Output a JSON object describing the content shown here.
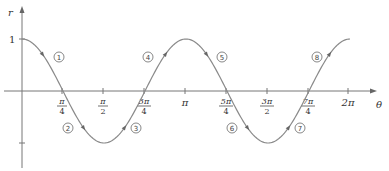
{
  "chart_data": {
    "type": "line",
    "title": "",
    "function": "r = cos 2θ",
    "xlabel": "θ",
    "ylabel": "r",
    "xlim": [
      0,
      6.2832
    ],
    "ylim": [
      -1,
      1
    ],
    "grid": false,
    "legend": null,
    "x_ticks": [
      {
        "value": 0.7854,
        "num": "π",
        "den": "4"
      },
      {
        "value": 1.5708,
        "num": "π",
        "den": "2"
      },
      {
        "value": 2.3562,
        "num": "3π",
        "den": "4"
      },
      {
        "value": 3.1416,
        "label": "π"
      },
      {
        "value": 3.927,
        "num": "5π",
        "den": "4"
      },
      {
        "value": 4.7124,
        "num": "3π",
        "den": "2"
      },
      {
        "value": 5.4978,
        "num": "7π",
        "den": "4"
      },
      {
        "value": 6.2832,
        "label": "2π"
      }
    ],
    "y_ticks": [
      {
        "value": 1,
        "label": "1"
      },
      {
        "value": -1,
        "label": ""
      }
    ],
    "series": [
      {
        "name": "cos 2θ",
        "x": [
          0,
          0.3927,
          0.7854,
          1.1781,
          1.5708,
          1.9635,
          2.3562,
          2.7489,
          3.1416,
          3.5343,
          3.927,
          4.3197,
          4.7124,
          5.1051,
          5.4978,
          5.8905,
          6.2832
        ],
        "values": [
          1,
          0.7071,
          0,
          -0.7071,
          -1,
          -0.7071,
          0,
          0.7071,
          1,
          0.7071,
          0,
          -0.7071,
          -1,
          -0.7071,
          0,
          0.7071,
          1
        ]
      }
    ],
    "annotations": [
      {
        "label": "①",
        "segment": 1,
        "theta_range": "0 to π/4"
      },
      {
        "label": "②",
        "segment": 2,
        "theta_range": "π/4 to π/2"
      },
      {
        "label": "③",
        "segment": 3,
        "theta_range": "π/2 to 3π/4"
      },
      {
        "label": "④",
        "segment": 4,
        "theta_range": "3π/4 to π"
      },
      {
        "label": "⑤",
        "segment": 5,
        "theta_range": "π to 5π/4"
      },
      {
        "label": "⑥",
        "segment": 6,
        "theta_range": "5π/4 to 3π/2"
      },
      {
        "label": "⑦",
        "segment": 7,
        "theta_range": "3π/2 to 7π/4"
      },
      {
        "label": "⑧",
        "segment": 8,
        "theta_range": "7π/4 to 2π"
      }
    ]
  },
  "labels": {
    "y_axis": "r",
    "x_axis": "θ",
    "y_one": "1",
    "pi": "π",
    "two_pi": "2π",
    "circled": [
      "1",
      "2",
      "3",
      "4",
      "5",
      "6",
      "7",
      "8"
    ]
  },
  "colors": {
    "axis": "#777777",
    "curve": "#8a8a8a",
    "text": "#333333"
  }
}
